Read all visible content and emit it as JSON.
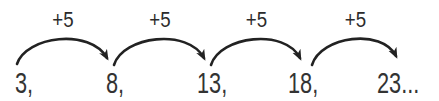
{
  "sequence": {
    "terms": [
      {
        "text": "3,",
        "value": 3
      },
      {
        "text": "8,",
        "value": 8
      },
      {
        "text": "13,",
        "value": 13
      },
      {
        "text": "18,",
        "value": 18
      },
      {
        "text": "23...",
        "value": 23
      }
    ],
    "operations": [
      {
        "label": "+5"
      },
      {
        "label": "+5"
      },
      {
        "label": "+5"
      },
      {
        "label": "+5"
      }
    ],
    "common_difference": 5
  },
  "icons": {
    "arrow": "curved-arrow-right-icon"
  },
  "colors": {
    "ink": "#222222",
    "text": "#333333",
    "background": "#ffffff"
  }
}
